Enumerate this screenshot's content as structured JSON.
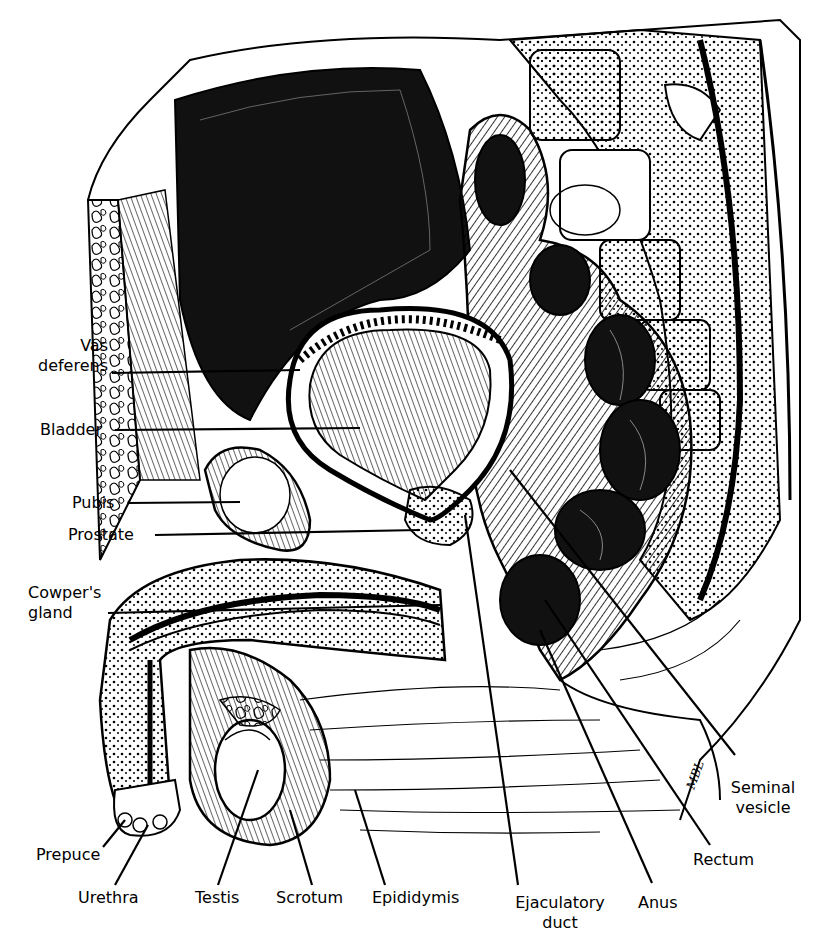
{
  "figure": {
    "signature": "MBL",
    "labels": [
      {
        "id": "vas_deferens",
        "text_line1": "Vas",
        "text_line2": "deferens"
      },
      {
        "id": "bladder",
        "text": "Bladder"
      },
      {
        "id": "pubis",
        "text": "Pubis"
      },
      {
        "id": "prostate",
        "text": "Prostate"
      },
      {
        "id": "cowpers_gland",
        "text_line1": "Cowper's",
        "text_line2": "gland"
      },
      {
        "id": "prepuce",
        "text": "Prepuce"
      },
      {
        "id": "urethra",
        "text": "Urethra"
      },
      {
        "id": "testis",
        "text": "Testis"
      },
      {
        "id": "scrotum",
        "text": "Scrotum"
      },
      {
        "id": "epididymis",
        "text": "Epididymis"
      },
      {
        "id": "ejaculatory_duct",
        "text_line1": "Ejaculatory",
        "text_line2": "duct"
      },
      {
        "id": "anus",
        "text": "Anus"
      },
      {
        "id": "rectum",
        "text": "Rectum"
      },
      {
        "id": "seminal_vesicle",
        "text_line1": "Seminal",
        "text_line2": "vesicle"
      }
    ]
  }
}
